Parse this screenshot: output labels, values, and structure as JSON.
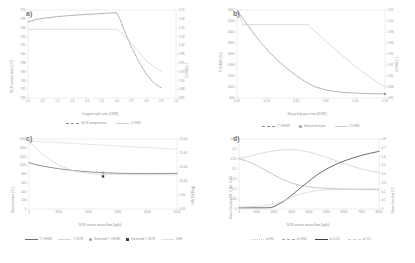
{
  "figure": {
    "panels": [
      "a)",
      "b)",
      "c)",
      "d)"
    ]
  },
  "palette": {
    "grid": "#e2e2e2",
    "axis": "#d8d8d8",
    "text": "#8f8f8f",
    "dark": "#4a4a4a",
    "mid": "#9b9b9b",
    "light": "#c6c6c6",
    "lighter": "#dcdcdc"
  },
  "chart_data": [
    {
      "panel": "a)",
      "type": "line",
      "title": "",
      "xlabel": "Oxygen split ratio [OSR]",
      "ylabel": "SCR temperature [°C]",
      "y2label": "CO/H2 [-]",
      "xlim": [
        0.0,
        1.0
      ],
      "ylim": [
        730,
        750
      ],
      "y2lim": [
        0.85,
        1.1
      ],
      "grid": false,
      "legend_position": "bottom",
      "xticks": [
        "0.0",
        "0.1",
        "0.2",
        "0.3",
        "0.4",
        "0.5",
        "0.6",
        "0.7",
        "0.8",
        "0.9",
        "1.0"
      ],
      "yticks": [
        "750",
        "748",
        "746",
        "744",
        "742",
        "740",
        "738",
        "736",
        "734",
        "732",
        "730"
      ],
      "y2ticks": [
        "1.10",
        "1.08",
        "1.05",
        "1.03",
        "1.00",
        "0.98",
        "0.95",
        "0.93",
        "0.90",
        "0.88",
        "0.85"
      ],
      "series": [
        {
          "name": "SCR temperature",
          "style": "dashed",
          "color": "#8c8c8c",
          "axis": "left",
          "x": [
            0.0,
            0.05,
            0.1,
            0.2,
            0.3,
            0.4,
            0.5,
            0.55,
            0.6,
            0.62,
            0.65,
            0.7,
            0.75,
            0.8,
            0.85,
            0.9
          ],
          "y": [
            747.3,
            747.8,
            748.1,
            748.5,
            748.8,
            749.0,
            749.2,
            749.3,
            749.4,
            748.0,
            745.4,
            741.5,
            738.2,
            735.4,
            733.4,
            732.3
          ]
        },
        {
          "name": "CO/H2",
          "style": "solid",
          "color": "#d2d2d2",
          "axis": "right",
          "x": [
            0.0,
            0.1,
            0.2,
            0.3,
            0.4,
            0.5,
            0.6,
            0.62,
            0.7,
            0.8,
            0.9
          ],
          "y": [
            1.045,
            1.045,
            1.045,
            1.045,
            1.045,
            1.045,
            1.045,
            1.04,
            1.005,
            0.955,
            0.925
          ]
        }
      ],
      "legend": [
        "SCR temperature",
        "CO/H2"
      ]
    },
    {
      "panel": "b)",
      "type": "line",
      "title": "",
      "xlabel": "Recycling gas ratio [RGR]",
      "ylabel": "T CHGR [°C]",
      "y2label": "CO/H2 [-]",
      "xlim": [
        0.0,
        0.5
      ],
      "ylim": [
        800,
        2400
      ],
      "y2lim": [
        0.8,
        1.04
      ],
      "grid": false,
      "legend_position": "bottom",
      "xticks": [
        "0.00",
        "0.10",
        "0.20",
        "0.30",
        "0.40",
        "0.50"
      ],
      "yticks": [
        "2400",
        "2200",
        "2000",
        "1800",
        "1600",
        "1400",
        "1200",
        "1000",
        "800"
      ],
      "y2ticks": [
        "1.04",
        "1.00",
        "0.98",
        "0.96",
        "0.94",
        "0.92",
        "0.90",
        "0.88",
        "0.80"
      ],
      "series": [
        {
          "name": "T CHGR",
          "style": "dashed",
          "color": "#8c8c8c",
          "axis": "left",
          "x": [
            0.0,
            0.02,
            0.05,
            0.08,
            0.11,
            0.14,
            0.17,
            0.2,
            0.23,
            0.26,
            0.3,
            0.35,
            0.4,
            0.45,
            0.5
          ],
          "y": [
            2400,
            2240,
            2020,
            1810,
            1630,
            1470,
            1330,
            1210,
            1100,
            1010,
            945,
            905,
            890,
            880,
            875
          ]
        },
        {
          "name": "CO/H2",
          "style": "solid",
          "color": "#cfcfcf",
          "axis": "right",
          "x": [
            0.0,
            0.02,
            0.05,
            0.1,
            0.15,
            0.2,
            0.24,
            0.3,
            0.35,
            0.4,
            0.45,
            0.5
          ],
          "y": [
            1.04,
            1.0,
            1.0,
            1.0,
            1.0,
            1.0,
            1.0,
            0.955,
            0.92,
            0.886,
            0.856,
            0.83
          ]
        },
        {
          "name": "Selected value",
          "style": "marker",
          "color": "#9b9b9b",
          "axis": "left",
          "x": [
            0.5
          ],
          "y": [
            875
          ]
        }
      ],
      "legend": [
        "T CHGR",
        "Selected value",
        "CO/H2"
      ]
    },
    {
      "panel": "c)",
      "type": "line",
      "title": "",
      "xlabel": "SOS steam mass flow [kg/h]",
      "ylabel": "Temperature [°C]",
      "y2label": "LHV [MJ/kg]",
      "xlim": [
        0,
        5000
      ],
      "ylim": [
        0,
        1600
      ],
      "y2lim": [
        0,
        25
      ],
      "grid": false,
      "legend_position": "bottom",
      "xticks": [
        "0",
        "1000",
        "2000",
        "3000",
        "4000",
        "5000"
      ],
      "yticks": [
        "1600",
        "1400",
        "1200",
        "1000",
        "800",
        "600",
        "400",
        "200",
        "0"
      ],
      "y2ticks": [
        "25.00",
        "20.00",
        "15.00",
        "10.00",
        "5.00",
        "0.00"
      ],
      "series": [
        {
          "name": "T CHGR",
          "style": "solid",
          "color": "#6f6f6f",
          "axis": "left",
          "x": [
            0,
            250,
            500,
            1000,
            1500,
            2000,
            2500,
            3000,
            3500,
            4000,
            4500,
            5000
          ],
          "y": [
            1060,
            1010,
            975,
            920,
            880,
            850,
            830,
            818,
            812,
            810,
            812,
            815
          ]
        },
        {
          "name": "T SCR",
          "style": "solid",
          "color": "#d6d6d6",
          "axis": "left",
          "x": [
            0,
            250,
            500,
            1000,
            1500,
            2000,
            2500,
            3000,
            3500,
            4000,
            4500,
            5000
          ],
          "y": [
            1540,
            1380,
            1230,
            1000,
            870,
            810,
            790,
            785,
            783,
            782,
            782,
            782
          ]
        },
        {
          "name": "LHV",
          "style": "solid",
          "color": "#e0e0e0",
          "axis": "right",
          "x": [
            0,
            500,
            1000,
            1500,
            2000,
            2500,
            3000,
            3500,
            4000,
            4500,
            5000
          ],
          "y": [
            24.3,
            24.0,
            23.7,
            23.4,
            23.1,
            22.8,
            22.5,
            22.2,
            21.9,
            21.6,
            21.3
          ]
        },
        {
          "name": "Selected T CHGR",
          "style": "marker",
          "color": "#9b9b9b",
          "axis": "left",
          "x": [
            2500
          ],
          "y": [
            830
          ]
        },
        {
          "name": "Selected T SCR",
          "style": "marker-square",
          "color": "#3a3a3a",
          "axis": "left",
          "x": [
            2500
          ],
          "y": [
            745
          ]
        }
      ],
      "legend": [
        "T CHGR",
        "T SCR",
        "Selected T CHGR",
        "Selected T SCR",
        "LHV"
      ]
    },
    {
      "panel": "d)",
      "type": "line",
      "title": "",
      "xlabel": "SCR steam mass flow [kg/h]",
      "ylabel": "Mass fraction H2, CH4, CO2",
      "y2label": "Mass fraction CO",
      "xlim": [
        0,
        8000
      ],
      "ylim": [
        0,
        0.35
      ],
      "y2lim": [
        0,
        0.8
      ],
      "grid": false,
      "legend_position": "bottom",
      "xticks": [
        "0",
        "1000",
        "2000",
        "3000",
        "4000",
        "5000",
        "6000",
        "7000",
        "8000"
      ],
      "yticks": [
        "0.35",
        "0.3",
        "0.25",
        "0.2",
        "0.15",
        "0.1",
        "0.05",
        "0"
      ],
      "y2ticks": [
        "0.8",
        "0.7",
        "0.6",
        "0.5",
        "0.4",
        "0.3",
        "0.2",
        "0.1",
        "0"
      ],
      "series": [
        {
          "name": "w H2",
          "style": "dotted",
          "color": "#c9c9c9",
          "axis": "left",
          "x": [
            0,
            500,
            1000,
            1500,
            2000,
            2500,
            3000,
            3500,
            4000,
            4500,
            5000,
            5500,
            6000,
            6500,
            7000,
            7500,
            8000
          ],
          "y": [
            0.252,
            0.262,
            0.272,
            0.283,
            0.291,
            0.296,
            0.297,
            0.293,
            0.285,
            0.273,
            0.258,
            0.243,
            0.228,
            0.213,
            0.2,
            0.19,
            0.182
          ]
        },
        {
          "name": "w CH4",
          "style": "dashed",
          "color": "#a8a8a8",
          "axis": "left",
          "x": [
            0,
            500,
            1000,
            1500,
            2000,
            2500,
            3000,
            3500,
            4000,
            4500,
            5000,
            5500,
            6000,
            6500,
            7000,
            7500,
            8000
          ],
          "y": [
            0.252,
            0.238,
            0.218,
            0.195,
            0.17,
            0.148,
            0.13,
            0.118,
            0.111,
            0.106,
            0.103,
            0.101,
            0.1,
            0.099,
            0.098,
            0.097,
            0.097
          ]
        },
        {
          "name": "w CO2",
          "style": "solid",
          "color": "#3f3f3f",
          "axis": "left",
          "x": [
            0,
            500,
            1000,
            1500,
            1800,
            2000,
            2500,
            3000,
            3500,
            4000,
            4500,
            5000,
            5500,
            6000,
            6500,
            7000,
            7500,
            8000
          ],
          "y": [
            0.006,
            0.006,
            0.006,
            0.006,
            0.007,
            0.012,
            0.035,
            0.068,
            0.105,
            0.14,
            0.173,
            0.2,
            0.222,
            0.24,
            0.255,
            0.268,
            0.279,
            0.288
          ]
        },
        {
          "name": "w CO",
          "style": "dashdot",
          "color": "#cfcfcf",
          "axis": "right",
          "x": [
            0,
            500,
            1000,
            1500,
            2000,
            2500,
            3000,
            3500,
            4000,
            4500,
            5000,
            5500,
            6000,
            6500,
            7000,
            7500,
            8000
          ],
          "y": [
            0.02,
            0.025,
            0.03,
            0.04,
            0.055,
            0.09,
            0.135,
            0.17,
            0.195,
            0.21,
            0.218,
            0.222,
            0.225,
            0.226,
            0.228,
            0.229,
            0.23
          ]
        }
      ],
      "legend": [
        "w H2",
        "w CH4",
        "w CO2",
        "w CO"
      ]
    }
  ]
}
